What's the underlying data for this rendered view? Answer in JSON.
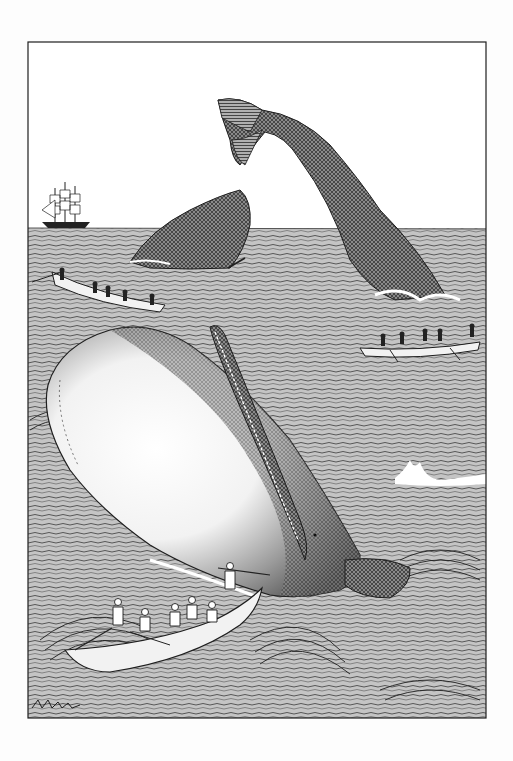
{
  "illustration": {
    "style": "monochrome pen-and-ink engraving",
    "colors": {
      "paper": "#fdfdfd",
      "sky": "#ffffff",
      "sea": "#c4c4c4",
      "ink": "#1e1e1e",
      "whale_light": "#f4f4f4",
      "whale_dark": "#6a6a6a",
      "boat": "#f2f2f2",
      "foam": "#ffffff"
    },
    "frame": {
      "x": 28,
      "y": 42,
      "width": 458,
      "height": 676
    },
    "horizon_y": 228,
    "elements": [
      {
        "name": "sailing-ship",
        "description": "three-masted ship on horizon",
        "x": 40,
        "y": 180
      },
      {
        "name": "diving-whale-fluke",
        "description": "whale tail rising from sea",
        "x": 215,
        "y": 97
      },
      {
        "name": "whale-head-left",
        "description": "dark whale head breaching",
        "x": 130,
        "y": 190
      },
      {
        "name": "whaleboat-left",
        "description": "whaleboat with crew rowing",
        "x": 35,
        "y": 265
      },
      {
        "name": "whaleboat-right",
        "description": "whaleboat with crew rowing",
        "x": 360,
        "y": 330
      },
      {
        "name": "white-whale",
        "description": "large white sperm whale breaching with open jaw",
        "x": 40,
        "y": 325
      },
      {
        "name": "whaleboat-foreground",
        "description": "whaleboat with harpooner and crew",
        "x": 60,
        "y": 585
      },
      {
        "name": "breaking-wave",
        "description": "wave crest with white foam",
        "x": 395,
        "y": 465
      }
    ]
  }
}
